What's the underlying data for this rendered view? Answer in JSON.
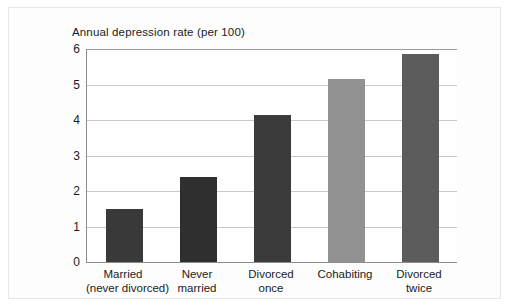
{
  "chart_data": {
    "type": "bar",
    "title": "Annual depression rate (per 100)",
    "xlabel": "",
    "ylabel": "",
    "ylim": [
      0,
      6
    ],
    "yticks": [
      "0",
      "1",
      "2",
      "3",
      "4",
      "5",
      "6"
    ],
    "grid": true,
    "legend": null,
    "categories": [
      "Married (never divorced)",
      "Never married",
      "Divorced once",
      "Cohabiting",
      "Divorced twice"
    ],
    "category_lines": [
      [
        "Married",
        "(never divorced)"
      ],
      [
        "Never",
        "married"
      ],
      [
        "Divorced",
        "once"
      ],
      [
        "Cohabiting",
        ""
      ],
      [
        "Divorced",
        "twice"
      ]
    ],
    "values": [
      1.5,
      2.4,
      4.15,
      5.15,
      5.85
    ],
    "bar_colors": [
      "#393939",
      "#2f2f2f",
      "#3b3b3b",
      "#919191",
      "#5c5c5c"
    ]
  },
  "colors": {
    "background": "#ffffff",
    "plot_background": "#ffffff",
    "axis": "#8c8c8c",
    "gridline": "#c9c9c9",
    "text": "#1b1b1b",
    "frame": "#e7e7e7"
  }
}
